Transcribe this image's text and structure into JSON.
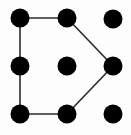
{
  "pattern_lock": {
    "grid": {
      "rows": 3,
      "cols": 3
    },
    "colors": {
      "dot": "#000000",
      "line": "#2a2a2a",
      "background": "#fdfdfd"
    },
    "dots": [
      {
        "id": "r0c0",
        "row": 0,
        "col": 0,
        "cx": 20,
        "cy": 18
      },
      {
        "id": "r0c1",
        "row": 0,
        "col": 1,
        "cx": 67,
        "cy": 18
      },
      {
        "id": "r0c2",
        "row": 0,
        "col": 2,
        "cx": 113,
        "cy": 19
      },
      {
        "id": "r1c0",
        "row": 1,
        "col": 0,
        "cx": 20,
        "cy": 66
      },
      {
        "id": "r1c1",
        "row": 1,
        "col": 1,
        "cx": 67,
        "cy": 66
      },
      {
        "id": "r1c2",
        "row": 1,
        "col": 2,
        "cx": 113,
        "cy": 66
      },
      {
        "id": "r2c0",
        "row": 2,
        "col": 0,
        "cx": 20,
        "cy": 114
      },
      {
        "id": "r2c1",
        "row": 2,
        "col": 1,
        "cx": 67,
        "cy": 114
      },
      {
        "id": "r2c2",
        "row": 2,
        "col": 2,
        "cx": 113,
        "cy": 114
      }
    ],
    "dot_radius": 9.5,
    "path": [
      "r0c1",
      "r0c0",
      "r1c0",
      "r2c0",
      "r2c1",
      "r1c2",
      "r0c1"
    ]
  }
}
